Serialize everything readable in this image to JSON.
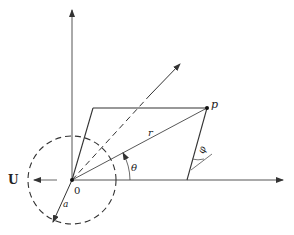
{
  "diagram": {
    "labels": {
      "point_p": "p",
      "origin": "0",
      "radius_r": "r",
      "angle_theta": "θ",
      "angle_phi": "φ",
      "velocity_u": "U",
      "circle_radius_a": "a"
    },
    "colors": {
      "line": "#333333",
      "background": "#ffffff"
    }
  }
}
